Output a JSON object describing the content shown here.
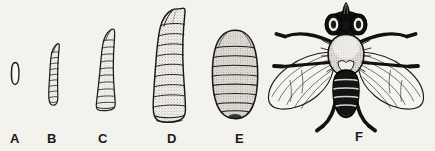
{
  "figure": {
    "title": "Life cycle stages of the house fly",
    "background_color": "#f4f2ec",
    "ink_color": "#1a1a1a",
    "width": 435,
    "height": 151
  },
  "stages": [
    {
      "label": "A",
      "name": "egg",
      "label_x": 10,
      "label_y": 132,
      "description": "Small elongate white egg, vertical oval outline"
    },
    {
      "label": "B",
      "name": "first-instar-larva",
      "label_x": 47,
      "label_y": 132,
      "description": "Slender curved segmented maggot, smallest larval stage"
    },
    {
      "label": "C",
      "name": "second-instar-larva",
      "label_x": 98,
      "label_y": 132,
      "description": "Medium tapered segmented maggot, broader posterior"
    },
    {
      "label": "D",
      "name": "third-instar-larva",
      "label_x": 167,
      "label_y": 132,
      "description": "Largest segmented maggot with hooked pointed head"
    },
    {
      "label": "E",
      "name": "pupa",
      "label_x": 235,
      "label_y": 132,
      "description": "Barrel-shaped stippled puparium with transverse segment bands"
    },
    {
      "label": "F",
      "name": "adult-fly",
      "label_x": 355,
      "label_y": 130,
      "description": "Adult house fly, dorsal view, wings spread, six legs, large compound eyes"
    }
  ]
}
